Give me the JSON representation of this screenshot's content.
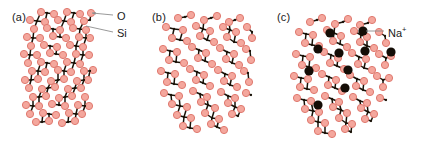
{
  "figure": {
    "width": 422,
    "height": 146,
    "background": "#ffffff"
  },
  "colors": {
    "oxygen_fill": "#f4a79d",
    "oxygen_stroke": "#e0796f",
    "silicon_fill": "#1a1208",
    "sodium_fill": "#140d06",
    "leader_line": "#8d8d8d",
    "text": "#1a1a1a"
  },
  "atoms": {
    "oxygen_radius": 3.6,
    "silicon_radius": 1.15,
    "sodium_radius": 4.6
  },
  "panels": [
    {
      "id": "a",
      "label": "(a)",
      "label_x": 12,
      "label_y": 11,
      "structure": "crystalline",
      "callouts": [
        {
          "name": "oxygen",
          "text": "O",
          "text_x": 117,
          "text_y": 10,
          "line": {
            "x1": 113,
            "y1": 15,
            "x2": 92,
            "y2": 13
          },
          "arrow": true
        },
        {
          "name": "silicon",
          "text": "Si",
          "text_x": 117,
          "text_y": 27,
          "line": {
            "x1": 113,
            "y1": 32,
            "x2": 86,
            "y2": 26
          },
          "arrow": false
        }
      ]
    },
    {
      "id": "b",
      "label": "(b)",
      "label_x": 152,
      "label_y": 11,
      "structure": "amorphous",
      "callouts": []
    },
    {
      "id": "c",
      "label": "(c)",
      "label_x": 277,
      "label_y": 11,
      "structure": "sodium-silicate",
      "callouts": [
        {
          "name": "sodium",
          "text": "Na",
          "superscript": "+",
          "text_x": 388,
          "text_y": 27,
          "line": {
            "x1": 384,
            "y1": 31,
            "x2": 366,
            "y2": 31
          },
          "arrow": false
        }
      ]
    }
  ],
  "chart_data": {
    "type": "diagram",
    "title": "",
    "legend": [
      {
        "symbol": "O",
        "label": "O",
        "depiction": "large pink circle",
        "color": "#f4a79d"
      },
      {
        "symbol": "Si",
        "label": "Si",
        "depiction": "small black dot",
        "color": "#1a1208"
      },
      {
        "symbol": "Na+",
        "label": "Na⁺",
        "depiction": "large black circle",
        "color": "#140d06"
      }
    ],
    "panel_a_oxygens": [
      [
        41,
        12
      ],
      [
        54,
        14
      ],
      [
        67,
        12
      ],
      [
        80,
        14
      ],
      [
        91,
        13
      ],
      [
        30,
        20
      ],
      [
        45,
        22
      ],
      [
        58,
        20
      ],
      [
        71,
        22
      ],
      [
        84,
        21
      ],
      [
        34,
        29
      ],
      [
        47,
        28
      ],
      [
        60,
        30
      ],
      [
        73,
        28
      ],
      [
        86,
        30
      ],
      [
        27,
        37
      ],
      [
        40,
        38
      ],
      [
        53,
        36
      ],
      [
        66,
        38
      ],
      [
        79,
        37
      ],
      [
        90,
        38
      ],
      [
        31,
        46
      ],
      [
        44,
        45
      ],
      [
        57,
        47
      ],
      [
        70,
        45
      ],
      [
        83,
        47
      ],
      [
        24,
        54
      ],
      [
        37,
        55
      ],
      [
        50,
        53
      ],
      [
        63,
        55
      ],
      [
        76,
        54
      ],
      [
        89,
        55
      ],
      [
        28,
        63
      ],
      [
        41,
        62
      ],
      [
        54,
        64
      ],
      [
        67,
        62
      ],
      [
        80,
        64
      ],
      [
        32,
        71
      ],
      [
        45,
        72
      ],
      [
        58,
        70
      ],
      [
        71,
        72
      ],
      [
        84,
        71
      ],
      [
        93,
        70
      ],
      [
        25,
        80
      ],
      [
        38,
        79
      ],
      [
        51,
        81
      ],
      [
        64,
        79
      ],
      [
        77,
        81
      ],
      [
        88,
        80
      ],
      [
        29,
        88
      ],
      [
        42,
        89
      ],
      [
        55,
        87
      ],
      [
        68,
        89
      ],
      [
        81,
        88
      ],
      [
        33,
        97
      ],
      [
        46,
        96
      ],
      [
        59,
        98
      ],
      [
        72,
        96
      ],
      [
        85,
        97
      ],
      [
        26,
        105
      ],
      [
        39,
        106
      ],
      [
        52,
        104
      ],
      [
        65,
        106
      ],
      [
        78,
        105
      ],
      [
        89,
        106
      ],
      [
        30,
        114
      ],
      [
        43,
        113
      ],
      [
        56,
        115
      ],
      [
        69,
        113
      ],
      [
        82,
        114
      ],
      [
        36,
        122
      ],
      [
        49,
        121
      ],
      [
        62,
        123
      ],
      [
        75,
        121
      ]
    ],
    "panel_a_silicons": [
      [
        47,
        13
      ],
      [
        74,
        13
      ],
      [
        37,
        21
      ],
      [
        64,
        21
      ],
      [
        90,
        20
      ],
      [
        53,
        29
      ],
      [
        80,
        29
      ],
      [
        33,
        38
      ],
      [
        60,
        37
      ],
      [
        86,
        38
      ],
      [
        50,
        46
      ],
      [
        76,
        46
      ],
      [
        30,
        55
      ],
      [
        56,
        54
      ],
      [
        83,
        55
      ],
      [
        47,
        63
      ],
      [
        74,
        63
      ],
      [
        38,
        71
      ],
      [
        64,
        71
      ],
      [
        90,
        71
      ],
      [
        31,
        80
      ],
      [
        58,
        80
      ],
      [
        84,
        80
      ],
      [
        48,
        88
      ],
      [
        75,
        88
      ],
      [
        39,
        97
      ],
      [
        65,
        97
      ],
      [
        33,
        106
      ],
      [
        59,
        105
      ],
      [
        85,
        106
      ],
      [
        49,
        114
      ],
      [
        76,
        114
      ],
      [
        42,
        122
      ],
      [
        68,
        122
      ]
    ],
    "panel_b_oxygens": [
      [
        178,
        18
      ],
      [
        191,
        15
      ],
      [
        204,
        20
      ],
      [
        217,
        16
      ],
      [
        229,
        22
      ],
      [
        240,
        18
      ],
      [
        166,
        27
      ],
      [
        183,
        30
      ],
      [
        196,
        26
      ],
      [
        210,
        31
      ],
      [
        223,
        27
      ],
      [
        236,
        32
      ],
      [
        247,
        27
      ],
      [
        172,
        38
      ],
      [
        187,
        41
      ],
      [
        200,
        36
      ],
      [
        214,
        42
      ],
      [
        227,
        37
      ],
      [
        241,
        43
      ],
      [
        252,
        38
      ],
      [
        163,
        49
      ],
      [
        177,
        52
      ],
      [
        192,
        47
      ],
      [
        206,
        53
      ],
      [
        220,
        48
      ],
      [
        234,
        54
      ],
      [
        246,
        49
      ],
      [
        169,
        60
      ],
      [
        184,
        63
      ],
      [
        198,
        58
      ],
      [
        212,
        64
      ],
      [
        226,
        59
      ],
      [
        239,
        65
      ],
      [
        251,
        60
      ],
      [
        161,
        71
      ],
      [
        175,
        74
      ],
      [
        190,
        69
      ],
      [
        204,
        75
      ],
      [
        218,
        70
      ],
      [
        232,
        76
      ],
      [
        244,
        71
      ],
      [
        167,
        82
      ],
      [
        182,
        85
      ],
      [
        196,
        80
      ],
      [
        210,
        86
      ],
      [
        224,
        81
      ],
      [
        237,
        87
      ],
      [
        249,
        82
      ],
      [
        164,
        93
      ],
      [
        179,
        96
      ],
      [
        193,
        91
      ],
      [
        207,
        97
      ],
      [
        221,
        92
      ],
      [
        235,
        98
      ],
      [
        246,
        93
      ],
      [
        172,
        104
      ],
      [
        187,
        107
      ],
      [
        201,
        102
      ],
      [
        215,
        108
      ],
      [
        228,
        103
      ],
      [
        241,
        109
      ],
      [
        177,
        115
      ],
      [
        191,
        118
      ],
      [
        205,
        113
      ],
      [
        219,
        119
      ],
      [
        232,
        114
      ],
      [
        183,
        126
      ],
      [
        197,
        129
      ],
      [
        211,
        124
      ],
      [
        224,
        130
      ]
    ],
    "panel_b_silicons": [
      [
        185,
        17
      ],
      [
        211,
        18
      ],
      [
        235,
        20
      ],
      [
        174,
        29
      ],
      [
        203,
        29
      ],
      [
        230,
        30
      ],
      [
        252,
        32
      ],
      [
        180,
        40
      ],
      [
        207,
        40
      ],
      [
        234,
        42
      ],
      [
        170,
        51
      ],
      [
        199,
        50
      ],
      [
        227,
        52
      ],
      [
        250,
        51
      ],
      [
        176,
        62
      ],
      [
        205,
        61
      ],
      [
        232,
        63
      ],
      [
        168,
        73
      ],
      [
        197,
        72
      ],
      [
        225,
        74
      ],
      [
        248,
        73
      ],
      [
        174,
        84
      ],
      [
        203,
        83
      ],
      [
        230,
        85
      ],
      [
        171,
        95
      ],
      [
        200,
        94
      ],
      [
        228,
        96
      ],
      [
        251,
        95
      ],
      [
        180,
        106
      ],
      [
        208,
        105
      ],
      [
        235,
        107
      ],
      [
        184,
        117
      ],
      [
        212,
        118
      ],
      [
        238,
        116
      ],
      [
        190,
        128
      ],
      [
        217,
        127
      ]
    ],
    "panel_c_oxygens": [
      [
        310,
        22
      ],
      [
        322,
        18
      ],
      [
        335,
        24
      ],
      [
        348,
        19
      ],
      [
        360,
        25
      ],
      [
        372,
        20
      ],
      [
        299,
        32
      ],
      [
        313,
        35
      ],
      [
        327,
        30
      ],
      [
        341,
        36
      ],
      [
        354,
        31
      ],
      [
        367,
        37
      ],
      [
        379,
        32
      ],
      [
        305,
        43
      ],
      [
        319,
        46
      ],
      [
        333,
        41
      ],
      [
        347,
        47
      ],
      [
        360,
        42
      ],
      [
        374,
        48
      ],
      [
        386,
        43
      ],
      [
        296,
        54
      ],
      [
        310,
        57
      ],
      [
        324,
        52
      ],
      [
        338,
        58
      ],
      [
        352,
        53
      ],
      [
        366,
        59
      ],
      [
        379,
        54
      ],
      [
        391,
        56
      ],
      [
        302,
        65
      ],
      [
        316,
        68
      ],
      [
        330,
        63
      ],
      [
        344,
        69
      ],
      [
        358,
        64
      ],
      [
        372,
        70
      ],
      [
        385,
        65
      ],
      [
        294,
        76
      ],
      [
        308,
        79
      ],
      [
        322,
        74
      ],
      [
        336,
        80
      ],
      [
        350,
        75
      ],
      [
        364,
        81
      ],
      [
        377,
        76
      ],
      [
        389,
        78
      ],
      [
        300,
        87
      ],
      [
        314,
        90
      ],
      [
        328,
        85
      ],
      [
        342,
        91
      ],
      [
        356,
        86
      ],
      [
        370,
        92
      ],
      [
        383,
        87
      ],
      [
        297,
        98
      ],
      [
        311,
        101
      ],
      [
        325,
        96
      ],
      [
        339,
        102
      ],
      [
        353,
        97
      ],
      [
        367,
        103
      ],
      [
        380,
        98
      ],
      [
        305,
        109
      ],
      [
        319,
        112
      ],
      [
        333,
        107
      ],
      [
        347,
        113
      ],
      [
        361,
        108
      ],
      [
        374,
        114
      ],
      [
        311,
        120
      ],
      [
        325,
        123
      ],
      [
        339,
        118
      ],
      [
        352,
        124
      ],
      [
        365,
        119
      ],
      [
        318,
        131
      ],
      [
        332,
        134
      ],
      [
        345,
        129
      ]
    ],
    "panel_c_silicons": [
      [
        317,
        20
      ],
      [
        343,
        22
      ],
      [
        368,
        23
      ],
      [
        306,
        34
      ],
      [
        334,
        33
      ],
      [
        361,
        35
      ],
      [
        385,
        36
      ],
      [
        312,
        45
      ],
      [
        340,
        44
      ],
      [
        367,
        46
      ],
      [
        303,
        56
      ],
      [
        331,
        55
      ],
      [
        359,
        57
      ],
      [
        386,
        58
      ],
      [
        309,
        67
      ],
      [
        337,
        66
      ],
      [
        364,
        68
      ],
      [
        301,
        78
      ],
      [
        329,
        77
      ],
      [
        357,
        79
      ],
      [
        383,
        80
      ],
      [
        307,
        89
      ],
      [
        335,
        88
      ],
      [
        363,
        90
      ],
      [
        304,
        100
      ],
      [
        332,
        99
      ],
      [
        360,
        101
      ],
      [
        386,
        100
      ],
      [
        313,
        111
      ],
      [
        341,
        110
      ],
      [
        368,
        112
      ],
      [
        318,
        122
      ],
      [
        346,
        123
      ],
      [
        371,
        121
      ],
      [
        325,
        133
      ],
      [
        351,
        132
      ]
    ],
    "panel_c_sodiums": [
      [
        330,
        33
      ],
      [
        363,
        31
      ],
      [
        318,
        49
      ],
      [
        339,
        53
      ],
      [
        365,
        51
      ],
      [
        391,
        52
      ],
      [
        309,
        71
      ],
      [
        348,
        70
      ],
      [
        345,
        88
      ],
      [
        318,
        105
      ]
    ]
  }
}
